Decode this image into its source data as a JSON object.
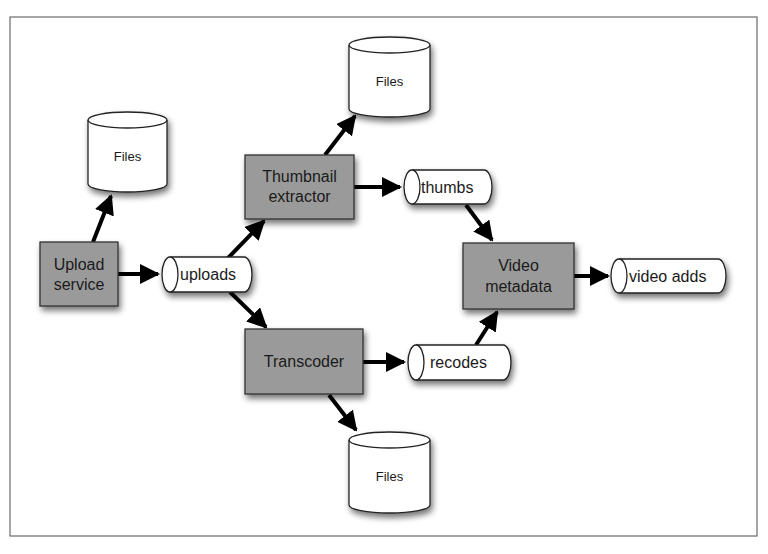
{
  "diagram": {
    "title": "",
    "colors": {
      "process_fill": "#9a9a9a",
      "store_fill": "#ffffff",
      "stroke": "#222222",
      "arrow": "#000000",
      "frame": "#666666"
    },
    "nodes": {
      "upload_service": {
        "line1": "Upload",
        "line2": "service",
        "type": "process"
      },
      "thumbnail_extractor": {
        "line1": "Thumbnail",
        "line2": "extractor",
        "type": "process"
      },
      "transcoder": {
        "label": "Transcoder",
        "type": "process"
      },
      "video_metadata": {
        "line1": "Video",
        "line2": "metadata",
        "type": "process"
      },
      "files_upload": {
        "label": "Files",
        "type": "storage"
      },
      "files_thumbnail": {
        "label": "Files",
        "type": "storage"
      },
      "files_transcoder": {
        "label": "Files",
        "type": "storage"
      },
      "uploads_queue": {
        "label": "uploads",
        "type": "queue"
      },
      "thumbs_queue": {
        "label": "thumbs",
        "type": "queue"
      },
      "recodes_queue": {
        "label": "recodes",
        "type": "queue"
      },
      "video_adds_queue": {
        "label": "video adds",
        "type": "queue"
      }
    },
    "edges": [
      {
        "from": "Upload service",
        "to": "Files"
      },
      {
        "from": "Upload service",
        "to": "uploads"
      },
      {
        "from": "uploads",
        "to": "Thumbnail extractor"
      },
      {
        "from": "uploads",
        "to": "Transcoder"
      },
      {
        "from": "Thumbnail extractor",
        "to": "Files"
      },
      {
        "from": "Thumbnail extractor",
        "to": "thumbs"
      },
      {
        "from": "Transcoder",
        "to": "recodes"
      },
      {
        "from": "Transcoder",
        "to": "Files"
      },
      {
        "from": "thumbs",
        "to": "Video metadata"
      },
      {
        "from": "recodes",
        "to": "Video metadata"
      },
      {
        "from": "Video metadata",
        "to": "video adds"
      }
    ]
  }
}
